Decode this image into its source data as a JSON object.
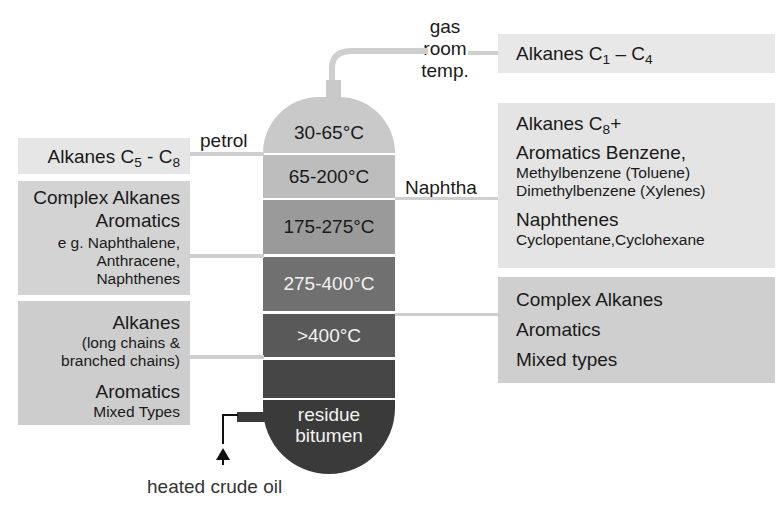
{
  "column": {
    "top_label": [
      "gas",
      "room",
      "temp."
    ],
    "sections": [
      {
        "label": "30-65°C",
        "color": "#c9c9c9",
        "text_color": "#1a1a1a"
      },
      {
        "label": "65-200°C",
        "color": "#bdbdbd",
        "text_color": "#1a1a1a"
      },
      {
        "label": "175-275°C",
        "color": "#9a9a9a",
        "text_color": "#1a1a1a"
      },
      {
        "label": "275-400°C",
        "color": "#707070",
        "text_color": "#f2f2f2"
      },
      {
        "label": ">400°C",
        "color": "#595959",
        "text_color": "#f2f2f2"
      },
      {
        "label": "",
        "color": "#454545",
        "text_color": "#f2f2f2"
      },
      {
        "label": "residue",
        "label2": "bitumen",
        "color": "#3a3a3a",
        "text_color": "#f2f2f2"
      }
    ],
    "input_label": "heated crude oil"
  },
  "fractions": {
    "petrol": "petrol",
    "naphtha": "Naphtha"
  },
  "left_boxes": {
    "petrol_box": {
      "text": "Alkanes C",
      "sub1": "5",
      "mid": " - C",
      "sub2": "8"
    },
    "kerosene_box": {
      "line1": "Complex Alkanes",
      "line2": "Aromatics",
      "line3": "e g. Naphthalene,",
      "line4": "Anthracene,",
      "line5": "Naphthenes"
    },
    "heavy_box": {
      "line1": "Alkanes",
      "line2": "(long chains &",
      "line3": "branched chains)",
      "line4": "Aromatics",
      "line5": "Mixed Types"
    }
  },
  "right_boxes": {
    "gas_box": {
      "text": "Alkanes C",
      "sub1": "1",
      "mid": " – C",
      "sub2": "4"
    },
    "naphtha_box": {
      "line1": "Alkanes C",
      "line1_sub": "8",
      "line1_end": "+",
      "line2": "Aromatics Benzene,",
      "line3": "Methylbenzene (Toluene)",
      "line4": "Dimethylbenzene (Xylenes)",
      "line5": "Naphthenes",
      "line6": "Cyclopentane,Cyclohexane"
    },
    "gasoil_box": {
      "line1": "Complex Alkanes",
      "line2": "Aromatics",
      "line3": "Mixed types"
    }
  },
  "colors": {
    "box_light": "#e6e6e6",
    "box_mid": "#d6d6d6",
    "box_dark": "#c8c8c8",
    "connector": "#cfcfcf"
  }
}
